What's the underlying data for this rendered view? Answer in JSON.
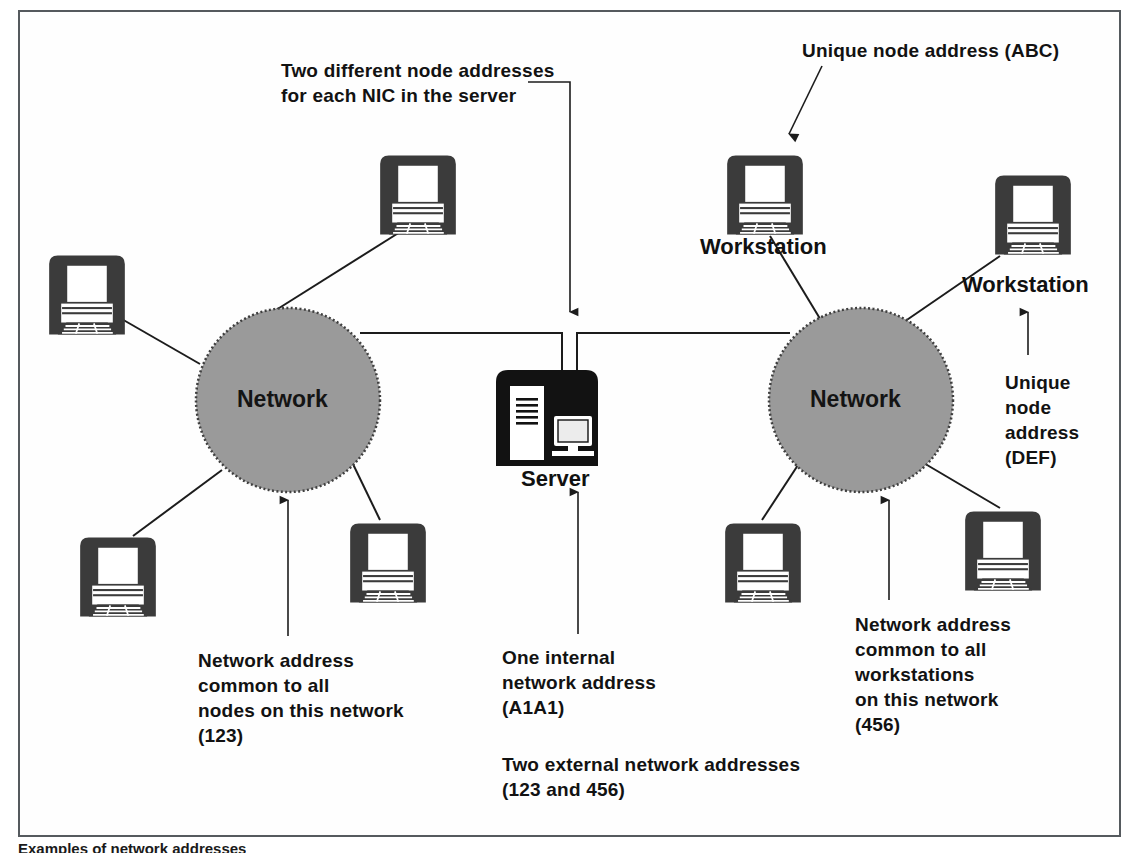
{
  "diagram": {
    "caption": "Examples of network addresses"
  },
  "colors": {
    "frame_border": "#555a5e",
    "cloud_fill": "#9a9a9a",
    "cloud_border": "#4a4a4a",
    "device_dark": "#3b3b3b",
    "server_dark": "#121212",
    "line": "#1c1c1c",
    "text": "#121212",
    "background": "#ffffff"
  },
  "clouds": [
    {
      "id": "left-network",
      "label": "Network",
      "cx": 288,
      "cy": 400,
      "r": 92
    },
    {
      "id": "right-network",
      "label": "Network",
      "cx": 861,
      "cy": 400,
      "r": 92
    }
  ],
  "server": {
    "label": "Server",
    "x": 492,
    "y": 368,
    "width": 110,
    "height": 100
  },
  "workstations": [
    {
      "id": "ws-left-top",
      "label": "",
      "x": 375,
      "y": 152,
      "size": 86
    },
    {
      "id": "ws-left-west",
      "label": "",
      "x": 44,
      "y": 252,
      "size": 86
    },
    {
      "id": "ws-left-southwest",
      "label": "",
      "x": 75,
      "y": 534,
      "size": 86
    },
    {
      "id": "ws-left-southeast",
      "label": "",
      "x": 345,
      "y": 520,
      "size": 86
    },
    {
      "id": "ws-right-top",
      "label": "Workstation",
      "x": 722,
      "y": 152,
      "size": 86
    },
    {
      "id": "ws-right-east",
      "label": "Workstation",
      "x": 990,
      "y": 172,
      "size": 86
    },
    {
      "id": "ws-right-southwest",
      "label": "",
      "x": 720,
      "y": 520,
      "size": 86
    },
    {
      "id": "ws-right-southeast",
      "label": "",
      "x": 960,
      "y": 508,
      "size": 86
    }
  ],
  "annotations": {
    "nic": {
      "id": "nic-note",
      "text": "Two different node addresses\nfor each NIC in the server",
      "x": 281,
      "y": 58
    },
    "unique_abc": {
      "id": "unique-abc-note",
      "text": "Unique node address (ABC)",
      "x": 802,
      "y": 38
    },
    "unique_def": {
      "id": "unique-def-note",
      "text": "Unique\nnode\naddress\n(DEF)",
      "x": 1005,
      "y": 370
    },
    "left_network_addr": {
      "id": "left-network-note",
      "text": "Network address\ncommon to all\nnodes on this network\n(123)",
      "x": 198,
      "y": 648
    },
    "server_internal": {
      "id": "server-address-note",
      "text": "One internal\nnetwork address\n(A1A1)",
      "x": 502,
      "y": 645
    },
    "server_external": {
      "id": "server-external-note",
      "text": "Two external network addresses\n(123 and 456)",
      "x": 502,
      "y": 752
    },
    "right_network_addr": {
      "id": "right-network-note",
      "text": "Network address\ncommon to all\nworkstations\non this network\n(456)",
      "x": 855,
      "y": 612
    }
  },
  "labels": {
    "server": "Server",
    "workstation": "Workstation",
    "network": "Network"
  }
}
